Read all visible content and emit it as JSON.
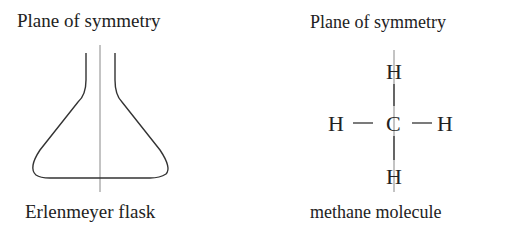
{
  "left_panel": {
    "title": "Plane of symmetry",
    "caption": "Erlenmeyer flask"
  },
  "right_panel": {
    "title": "Plane of symmetry",
    "caption": "methane molecule",
    "molecule": {
      "top": "H",
      "left": "H",
      "center": "C",
      "right": "H",
      "bottom": "H",
      "bond_left": "—",
      "bond_right": "—"
    }
  }
}
